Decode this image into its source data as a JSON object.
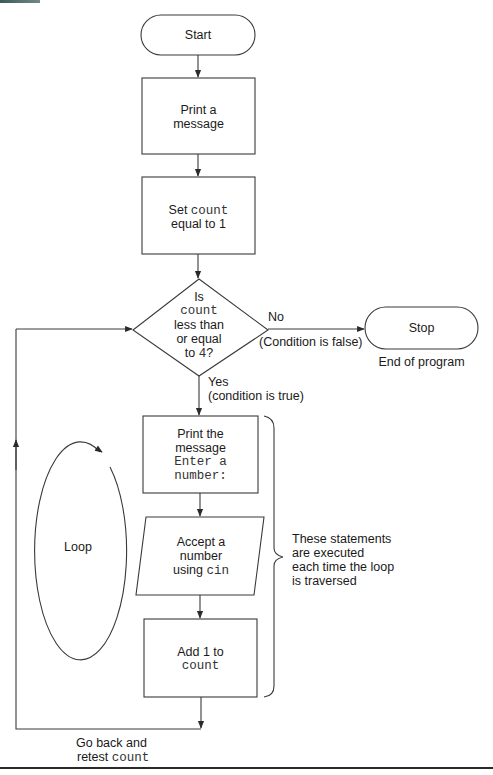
{
  "flowchart": {
    "start": {
      "label": "Start"
    },
    "print_message": {
      "line1": "Print a",
      "line2": "message"
    },
    "set_count": {
      "line1_text": "Set ",
      "line1_code": "count",
      "line2": "equal to 1"
    },
    "decision": {
      "line1": "Is",
      "line2_code": "count",
      "line3": "less than",
      "line4": "or equal",
      "line5_text": "to ",
      "line5_code": "4",
      "line5_suffix": "?"
    },
    "no_branch": {
      "label": "No",
      "note": "(Condition is false)"
    },
    "stop": {
      "label": "Stop",
      "caption": "End of program"
    },
    "yes_branch": {
      "label": "Yes",
      "note": "(condition is true)"
    },
    "print_prompt": {
      "line1": "Print the",
      "line2": "message",
      "line3_code": "Enter a",
      "line4_code": "number:"
    },
    "accept_input": {
      "line1": "Accept a",
      "line2": "number",
      "line3_text": "using ",
      "line3_code": "cin"
    },
    "increment": {
      "line1": "Add 1 to",
      "line2_code": "count"
    },
    "loop_label": "Loop",
    "brace_note": {
      "line1": "These statements",
      "line2": "are executed",
      "line3": "each time the loop",
      "line4": "is traversed"
    },
    "return_note": {
      "line1": "Go back and",
      "line2_text": "retest ",
      "line2_code": "count"
    }
  },
  "colors": {
    "stroke": "#3a3a3a",
    "text": "#1a1a1a",
    "code_text": "#333333",
    "background": "#ffffff"
  }
}
